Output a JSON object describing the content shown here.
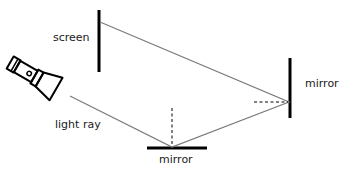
{
  "labels": {
    "screen": "screen",
    "mirror_right": "mirror",
    "mirror_bottom": "mirror",
    "light_ray": "light ray"
  },
  "colors": {
    "object": "#000000",
    "ray": "#7a7a7a",
    "normal": "#000000",
    "text": "#1a1a1a"
  },
  "diagram": {
    "elements": [
      "flashlight-icon",
      "light-ray",
      "bottom-mirror",
      "right-mirror",
      "screen",
      "normal-lines"
    ],
    "ray_path": [
      [
        70,
        96
      ],
      [
        172,
        147
      ],
      [
        289,
        102
      ],
      [
        100,
        22
      ]
    ]
  }
}
